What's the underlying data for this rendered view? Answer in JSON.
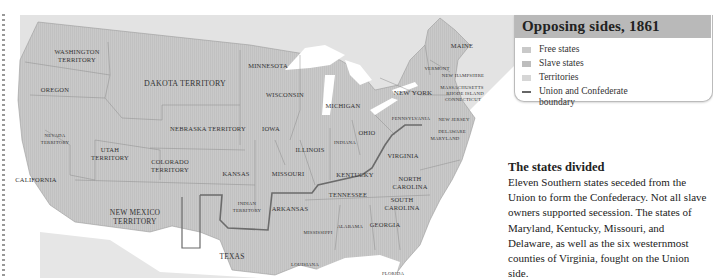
{
  "legend": {
    "title": "Opposing sides, 1861",
    "items": [
      {
        "label": "Free states",
        "swatch": "#c9c9c9"
      },
      {
        "label": "Slave states",
        "swatch": "#bdbdbd"
      },
      {
        "label": "Territories",
        "swatch": "#d6d6d6"
      },
      {
        "label": "Union and Confederate boundary",
        "swatch": "#666666",
        "type": "line"
      }
    ]
  },
  "article": {
    "heading": "The states divided",
    "body": "Eleven Southern states seceded from the Union to form the Confederacy. Not all slave owners supported secession. The states of Maryland, Kentucky, Missouri, and Delaware, as well as the six westernmost counties of Virginia, fought on the Union side."
  },
  "map": {
    "colors": {
      "land": "#c8c8c8",
      "territory": "#cfcfcf",
      "water": "#ffffff",
      "foreign": "#e2e2e2",
      "border": "#8a8a8a",
      "boundary": "#6a6a6a"
    },
    "labels": {
      "washington": "WASHINGTON",
      "washington2": "TERRITORY",
      "oregon": "OREGON",
      "dakota": "DAKOTA TERRITORY",
      "minnesota": "MINNESOTA",
      "wisconsin": "WISCONSIN",
      "michigan": "MICHIGAN",
      "newyork": "NEW YORK",
      "maine": "MAINE",
      "vermont": "VERMONT",
      "newhampshire": "NEW HAMPSHIRE",
      "massachusetts": "MASSACHUSETTS",
      "rhodeisland": "RHODE ISLAND",
      "connecticut": "CONNECTICUT",
      "pennsylvania": "PENNSYLVANIA",
      "newjersey": "NEW JERSEY",
      "delaware": "DELAWARE",
      "maryland": "MARYLAND",
      "nebraska": "NEBRASKA TERRITORY",
      "iowa": "IOWA",
      "ohio": "OHIO",
      "indiana": "INDIANA",
      "illinois": "ILLINOIS",
      "nevada": "NEVADA",
      "nevada2": "TERRITORY",
      "utah": "UTAH",
      "utah2": "TERRITORY",
      "colorado": "COLORADO",
      "colorado2": "TERRITORY",
      "california": "CALIFORNIA",
      "kansas": "KANSAS",
      "missouri": "MISSOURI",
      "kentucky": "KENTUCKY",
      "virginia": "VIRGINIA",
      "northcarolina": "NORTH",
      "northcarolina2": "CAROLINA",
      "tennessee": "TENNESSEE",
      "southcarolina": "SOUTH",
      "southcarolina2": "CAROLINA",
      "newmexico": "NEW MEXICO",
      "newmexico2": "TERRITORY",
      "indian": "INDIAN",
      "indian2": "TERRITORY",
      "arkansas": "ARKANSAS",
      "mississippi": "MISSISSIPPI",
      "alabama": "ALABAMA",
      "georgia": "GEORGIA",
      "texas": "TEXAS",
      "louisiana": "LOUISIANA",
      "florida": "FLORIDA"
    }
  }
}
